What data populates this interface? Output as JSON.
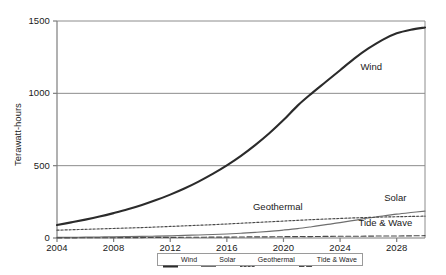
{
  "chart_data": {
    "type": "line",
    "title": "",
    "xlabel": "",
    "ylabel": "Terawatt-hours",
    "xlim": [
      2004,
      2030
    ],
    "ylim": [
      0,
      1500
    ],
    "grid": true,
    "gridlines_y": [
      500,
      1000,
      1500
    ],
    "legend_position": "bottom-center",
    "xticks": [
      "2004",
      "2008",
      "2012",
      "2016",
      "2020",
      "2024",
      "2028"
    ],
    "xtick_values": [
      2004,
      2008,
      2012,
      2016,
      2020,
      2024,
      2028
    ],
    "yticks": [
      "0",
      "500",
      "1000",
      "1500"
    ],
    "ytick_values": [
      0,
      500,
      1000,
      1500
    ],
    "x": [
      2004,
      2005,
      2006,
      2007,
      2008,
      2009,
      2010,
      2011,
      2012,
      2013,
      2014,
      2015,
      2016,
      2017,
      2018,
      2019,
      2020,
      2021,
      2022,
      2023,
      2024,
      2025,
      2026,
      2027,
      2028,
      2029,
      2030
    ],
    "series": [
      {
        "name": "Wind",
        "style": "solid-thick",
        "color": "#2b2b2b",
        "annotation": "Wind",
        "values": [
          90,
          108,
          127,
          148,
          172,
          198,
          228,
          262,
          300,
          342,
          390,
          443,
          502,
          568,
          642,
          724,
          815,
          915,
          1000,
          1080,
          1160,
          1240,
          1310,
          1370,
          1415,
          1440,
          1455
        ]
      },
      {
        "name": "Solar",
        "style": "solid-thin",
        "color": "#6e6e6e",
        "annotation": "Solar",
        "values": [
          4,
          5,
          6,
          7,
          8,
          10,
          11,
          13,
          15,
          18,
          21,
          24,
          28,
          33,
          39,
          46,
          55,
          65,
          78,
          92,
          106,
          122,
          138,
          152,
          165,
          176,
          186
        ]
      },
      {
        "name": "Geothermal",
        "style": "dotted",
        "color": "#4a4a4a",
        "annotation": "Geothermal",
        "values": [
          54,
          57,
          60,
          63,
          66,
          69,
          72,
          76,
          80,
          84,
          88,
          92,
          97,
          102,
          107,
          112,
          117,
          122,
          127,
          131,
          135,
          139,
          142,
          145,
          147,
          149,
          151
        ]
      },
      {
        "name": "Tide & Wave",
        "style": "dashed",
        "color": "#4a4a4a",
        "annotation": "Tide & Wave",
        "values": [
          1,
          1,
          2,
          2,
          2,
          3,
          3,
          4,
          4,
          5,
          5,
          6,
          6,
          7,
          8,
          8,
          9,
          10,
          10,
          11,
          12,
          12,
          13,
          14,
          14,
          15,
          16
        ]
      }
    ],
    "annotations": [
      {
        "text": "Wind",
        "x": 2026.2,
        "y": 1175
      },
      {
        "text": "Geothermal",
        "x": 2019.6,
        "y": 210
      },
      {
        "text": "Solar",
        "x": 2027.9,
        "y": 270
      },
      {
        "text": "Tide & Wave",
        "x": 2027.2,
        "y": 95
      }
    ],
    "legend": [
      {
        "label": "Wind",
        "style": "solid-thick",
        "color": "#2b2b2b"
      },
      {
        "label": "Solar",
        "style": "solid-thin",
        "color": "#6e6e6e"
      },
      {
        "label": "Geothermal",
        "style": "dotted",
        "color": "#4a4a4a"
      },
      {
        "label": "Tide & Wave",
        "style": "dashed",
        "color": "#4a4a4a"
      }
    ],
    "colors": {
      "background": "#ffffff",
      "axis": "#7d7d7d",
      "gridline": "#8c8c8c",
      "text": "#1a1a1a"
    }
  }
}
